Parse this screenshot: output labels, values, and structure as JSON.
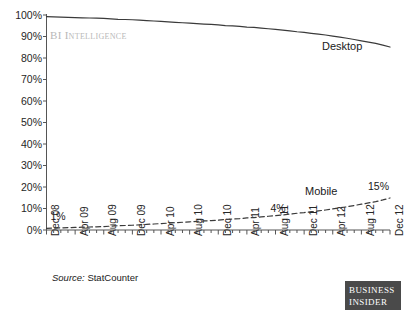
{
  "chart_data": {
    "type": "line",
    "title": "",
    "subtitle": "",
    "xlabel": "",
    "ylabel": "",
    "ylim": [
      0,
      100
    ],
    "ytick_labels": [
      "100%",
      "90%",
      "80%",
      "70%",
      "60%",
      "50%",
      "40%",
      "30%",
      "20%",
      "10%",
      "0%"
    ],
    "ytick_values": [
      100,
      90,
      80,
      70,
      60,
      50,
      40,
      30,
      20,
      10,
      0
    ],
    "grid": false,
    "legend_position": "inline-labels",
    "x_tick_labels": [
      "Dec 08",
      "Apr 09",
      "Aug 09",
      "Dec 09",
      "Apr 10",
      "Aug 10",
      "Dec 10",
      "Apr 11",
      "Aug 11",
      "Dec 11",
      "Apr 12",
      "Aug 12",
      "Dec 12"
    ],
    "x_minor_ticks_per_label": 4,
    "x": [
      "Dec 08",
      "Jan 09",
      "Feb 09",
      "Mar 09",
      "Apr 09",
      "May 09",
      "Jun 09",
      "Jul 09",
      "Aug 09",
      "Sep 09",
      "Oct 09",
      "Nov 09",
      "Dec 09",
      "Jan 10",
      "Feb 10",
      "Mar 10",
      "Apr 10",
      "May 10",
      "Jun 10",
      "Jul 10",
      "Aug 10",
      "Sep 10",
      "Oct 10",
      "Nov 10",
      "Dec 10",
      "Jan 11",
      "Feb 11",
      "Mar 11",
      "Apr 11",
      "May 11",
      "Jun 11",
      "Jul 11",
      "Aug 11",
      "Sep 11",
      "Oct 11",
      "Nov 11",
      "Dec 11",
      "Jan 12",
      "Feb 12",
      "Mar 12",
      "Apr 12",
      "May 12",
      "Jun 12",
      "Jul 12",
      "Aug 12",
      "Sep 12",
      "Oct 12",
      "Nov 12",
      "Dec 12"
    ],
    "series": [
      {
        "name": "Desktop",
        "style": "solid",
        "color": "#3a3a3a",
        "values": [
          99.2,
          99.1,
          99.0,
          98.9,
          98.8,
          98.7,
          98.6,
          98.5,
          98.4,
          98.2,
          98.0,
          97.9,
          97.8,
          97.6,
          97.4,
          97.2,
          97.0,
          96.8,
          96.6,
          96.4,
          96.2,
          96.0,
          95.8,
          95.6,
          95.4,
          95.1,
          94.9,
          94.7,
          94.4,
          94.2,
          93.9,
          93.6,
          93.3,
          93.0,
          92.6,
          92.2,
          91.9,
          91.5,
          91.1,
          90.7,
          90.2,
          89.7,
          89.2,
          88.6,
          88.0,
          87.4,
          86.8,
          86.0,
          85.1
        ]
      },
      {
        "name": "Mobile",
        "style": "dashed",
        "color": "#3a3a3a",
        "values": [
          0.8,
          0.9,
          1.0,
          1.1,
          1.2,
          1.3,
          1.4,
          1.5,
          1.6,
          1.8,
          2.0,
          2.1,
          2.2,
          2.4,
          2.6,
          2.8,
          3.0,
          3.2,
          3.4,
          3.6,
          3.8,
          4.0,
          4.2,
          4.4,
          4.6,
          4.9,
          5.1,
          5.3,
          5.6,
          5.8,
          6.1,
          6.4,
          6.7,
          7.0,
          7.4,
          7.8,
          8.1,
          8.5,
          8.9,
          9.3,
          9.8,
          10.3,
          10.8,
          11.4,
          12.0,
          12.6,
          13.2,
          14.0,
          14.9
        ]
      }
    ],
    "annotations": [
      {
        "text": "1%",
        "x_index": 0,
        "value": 1,
        "role": "start-value-mobile"
      },
      {
        "text": "4%",
        "x_index": 32,
        "value": 4,
        "role": "mid-value-mobile"
      },
      {
        "text": "15%",
        "x_index": 48,
        "value": 15,
        "role": "end-value-mobile"
      },
      {
        "text": "Desktop",
        "role": "series-label-desktop"
      },
      {
        "text": "Mobile",
        "role": "series-label-mobile"
      }
    ]
  },
  "watermark": {
    "text": "BI Intelligence",
    "color": "#b8b8b8"
  },
  "source": {
    "prefix": "Source:",
    "name": "StatCounter"
  },
  "logo": {
    "line1": "BUSINESS",
    "line2": "INSIDER",
    "background": "#4a4a4a",
    "text_color": "#ffffff"
  },
  "axis": {
    "color": "#555555"
  }
}
